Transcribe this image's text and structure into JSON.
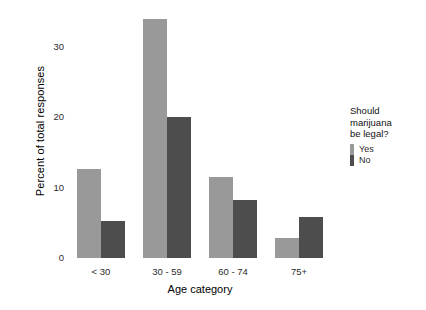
{
  "chart_data": {
    "type": "bar",
    "title": "",
    "subtitle": "",
    "xlabel": "Age category",
    "ylabel": "Percent of total responses",
    "categories": [
      "< 30",
      "30 - 59",
      "60 - 74",
      "75+"
    ],
    "series": [
      {
        "name": "Yes",
        "color": "#999999",
        "values": [
          12.7,
          34.0,
          11.5,
          2.8
        ]
      },
      {
        "name": "No",
        "color": "#4d4d4d",
        "values": [
          5.3,
          20.0,
          8.3,
          5.8
        ]
      }
    ],
    "ylim": [
      0,
      35
    ],
    "yticks": [
      0,
      10,
      20,
      30
    ],
    "ytick_labels": [
      "0",
      "10",
      "20",
      "30"
    ],
    "grid": false,
    "legend_position": "right",
    "legend_title": "Should marijuana be legal?",
    "background": "#ffffff"
  },
  "legend": {
    "title_line1": "Should",
    "title_line2": "marijuana",
    "title_line3": "be legal?",
    "items": [
      {
        "label": "Yes",
        "color": "#999999"
      },
      {
        "label": "No",
        "color": "#4d4d4d"
      }
    ]
  },
  "axes": {
    "y_title": "Percent of total responses",
    "x_title": "Age category",
    "y_tick_labels": [
      "0",
      "10",
      "20",
      "30"
    ],
    "x_tick_labels": [
      "< 30",
      "30 - 59",
      "60 - 74",
      "75+"
    ]
  }
}
